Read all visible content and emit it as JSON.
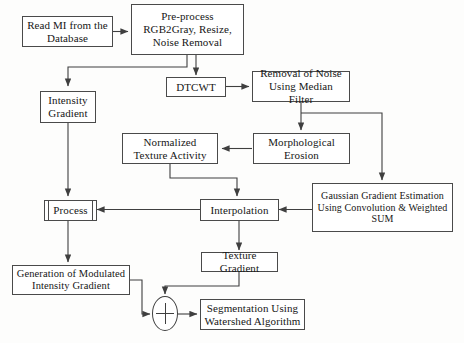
{
  "diagram": {
    "line_color": "#4a4a4a",
    "text_color": "#161616",
    "background": "#fdfdfc"
  },
  "nodes": {
    "read_mi": {
      "label": "Read MI from the Database",
      "line1": "Read MI from the",
      "line2": "Database"
    },
    "preprocess": {
      "line1": "Pre-process",
      "line2": "RGB2Gray, Resize,",
      "line3": "Noise Removal"
    },
    "dtcwt": {
      "label": "DTCWT"
    },
    "removal_noise": {
      "line1": "Removal of Noise",
      "line2": "Using Median Filter"
    },
    "intensity_gradient": {
      "line1": "Intensity",
      "line2": "Gradient"
    },
    "morphological_erosion": {
      "line1": "Morphological",
      "line2": "Erosion"
    },
    "normalized_texture": {
      "line1": "Normalized",
      "line2": "Texture Activity"
    },
    "process": {
      "label": "Process"
    },
    "interpolation": {
      "label": "Interpolation"
    },
    "gaussian_gradient": {
      "line1": "Gaussian Gradient Estimation",
      "line2": "Using Convolution & Weighted",
      "line3": "SUM"
    },
    "generation_modulated": {
      "line1": "Generation of Modulated",
      "line2": "Intensity Gradient"
    },
    "texture_gradient": {
      "label": "Texture Gradient"
    },
    "summation": {
      "label": "+"
    },
    "segmentation": {
      "line1": "Segmentation Using",
      "line2": "Watershed Algorithm"
    }
  }
}
